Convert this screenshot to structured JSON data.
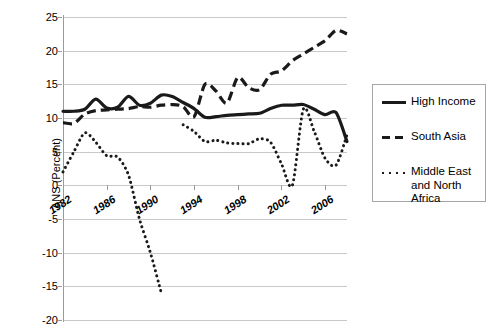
{
  "chart_data": {
    "type": "line",
    "title": "",
    "xlabel": "",
    "ylabel": "ANS (Percent)",
    "xlim": [
      1982,
      2008
    ],
    "ylim": [
      -20,
      25
    ],
    "grid": true,
    "legend_position": "right",
    "y_ticks": [
      25,
      20,
      15,
      10,
      5,
      0,
      -5,
      -10,
      -15,
      -20
    ],
    "y_tick_labels": [
      "25",
      "20",
      "15",
      "10",
      "5",
      "0",
      "-5",
      "-10",
      "-15",
      "-20"
    ],
    "x_ticks": [
      1982,
      1986,
      1990,
      1994,
      1998,
      2002,
      2006
    ],
    "x_tick_labels": [
      "1982",
      "1986",
      "1990",
      "1994",
      "1998",
      "2002",
      "2006"
    ],
    "x": [
      1982,
      1983,
      1984,
      1985,
      1986,
      1987,
      1988,
      1989,
      1990,
      1991,
      1992,
      1993,
      1994,
      1995,
      1996,
      1997,
      1998,
      1999,
      2000,
      2001,
      2002,
      2003,
      2004,
      2005,
      2006,
      2007,
      2008
    ],
    "series": [
      {
        "name": "High Income",
        "style": "solid",
        "color": "#1a1a1a",
        "values": [
          11.0,
          11.0,
          11.3,
          12.8,
          11.5,
          11.6,
          13.2,
          11.9,
          12.2,
          13.4,
          13.2,
          12.3,
          11.4,
          10.1,
          10.2,
          10.4,
          10.5,
          10.6,
          10.7,
          11.4,
          11.9,
          11.9,
          12.0,
          11.3,
          10.5,
          10.8,
          6.5
        ]
      },
      {
        "name": "South Asia",
        "style": "dashed",
        "color": "#1a1a1a",
        "values": [
          9.3,
          9.2,
          10.6,
          11.1,
          11.2,
          11.3,
          11.4,
          11.7,
          11.6,
          11.9,
          12.0,
          11.7,
          10.2,
          15.0,
          14.0,
          12.2,
          16.0,
          14.5,
          14.2,
          16.5,
          17.0,
          18.5,
          19.5,
          20.5,
          21.5,
          23.0,
          22.5
        ]
      },
      {
        "name": "Middle East and North Africa",
        "style": "dotted",
        "color": "#1a1a1a",
        "values": [
          2.0,
          5.0,
          7.8,
          6.4,
          4.4,
          4.2,
          1.5,
          -5.0,
          -10.0,
          -16.0,
          null,
          9.0,
          8.0,
          6.5,
          6.7,
          6.3,
          6.2,
          6.2,
          6.9,
          6.4,
          3.2,
          0.0,
          11.3,
          8.0,
          4.0,
          3.0,
          7.5
        ]
      }
    ]
  },
  "legend": {
    "items": [
      {
        "label": "High Income",
        "style": "solid"
      },
      {
        "label": "South Asia",
        "style": "dashed"
      },
      {
        "label": "Middle East\nand North\nAfrica",
        "style": "dotted"
      }
    ]
  }
}
